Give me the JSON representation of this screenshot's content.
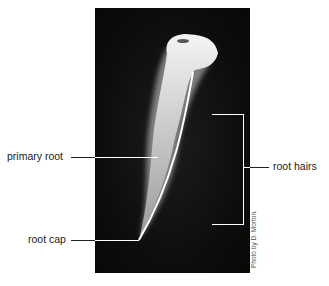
{
  "figure": {
    "labels": {
      "primary_root": "primary root",
      "root_cap": "root cap",
      "root_hairs": "root hairs"
    },
    "credit": "Photo by D. Morton."
  }
}
